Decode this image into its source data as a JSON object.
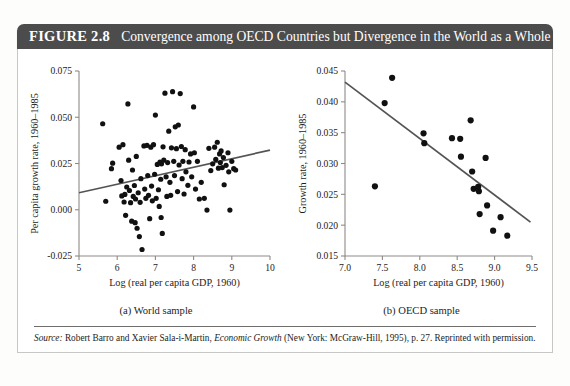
{
  "figure": {
    "number_label": "FIGURE 2.8",
    "title": "Convergence among OECD Countries but Divergence in the World as a Whole",
    "title_bar_color": "#4d4c4c",
    "title_text_color": "#ffffff",
    "border_color": "#c9c7c4",
    "source_prefix": "Source:",
    "source_text": " Robert Barro and Xavier Sala-i-Martin, ",
    "source_italic_work": "Economic Growth",
    "source_rest": " (New York: McGraw-Hill, 1995), p. 27. Reprinted with permission."
  },
  "captions": {
    "panel_a": "(a) World sample",
    "panel_b": "(b) OECD sample"
  },
  "chart_data": [
    {
      "type": "scatter",
      "panel": "a",
      "title": "",
      "xlabel": "Log (real per capita GDP, 1960)",
      "ylabel": "Per capita growth rate, 1960–1985",
      "xlim": [
        5,
        10
      ],
      "ylim": [
        -0.025,
        0.075
      ],
      "xticks": [
        5,
        6,
        7,
        8,
        9,
        10
      ],
      "xticklabels": [
        "5",
        "6",
        "7",
        "8",
        "9",
        "10"
      ],
      "yticks": [
        -0.025,
        0.0,
        0.025,
        0.05,
        0.075
      ],
      "yticklabels": [
        "-0.025",
        "0.000",
        "0.025",
        "0.050",
        "0.075"
      ],
      "grid": false,
      "legend": "none",
      "marker_color": "#111111",
      "trendline": {
        "color": "#555452",
        "x": [
          5.0,
          10.0
        ],
        "y": [
          0.0092,
          0.0322
        ]
      },
      "points": [
        [
          5.62,
          0.0465
        ],
        [
          5.7,
          0.0046
        ],
        [
          5.85,
          0.0222
        ],
        [
          5.88,
          0.0252
        ],
        [
          6.05,
          0.0338
        ],
        [
          6.1,
          0.0158
        ],
        [
          6.12,
          0.0075
        ],
        [
          6.15,
          0.0352
        ],
        [
          6.18,
          0.0042
        ],
        [
          6.2,
          0.0083
        ],
        [
          6.22,
          -0.003
        ],
        [
          6.25,
          0.0123
        ],
        [
          6.28,
          0.0572
        ],
        [
          6.3,
          0.0268
        ],
        [
          6.32,
          0.0104
        ],
        [
          6.35,
          0.0038
        ],
        [
          6.38,
          -0.0062
        ],
        [
          6.4,
          0.0215
        ],
        [
          6.42,
          0.0072
        ],
        [
          6.45,
          0.0131
        ],
        [
          6.47,
          -0.007
        ],
        [
          6.48,
          0.0058
        ],
        [
          6.5,
          0.0288
        ],
        [
          6.52,
          -0.01
        ],
        [
          6.55,
          0.0092
        ],
        [
          6.58,
          -0.0145
        ],
        [
          6.6,
          0.004
        ],
        [
          6.62,
          0.0168
        ],
        [
          6.65,
          -0.0215
        ],
        [
          6.7,
          0.0345
        ],
        [
          6.72,
          0.0112
        ],
        [
          6.75,
          0.0062
        ],
        [
          6.78,
          0.0348
        ],
        [
          6.8,
          0.0185
        ],
        [
          6.82,
          0.0078
        ],
        [
          6.85,
          -0.0048
        ],
        [
          6.88,
          0.0338
        ],
        [
          6.9,
          0.0128
        ],
        [
          6.92,
          0.0048
        ],
        [
          6.95,
          0.0352
        ],
        [
          6.98,
          0.0192
        ],
        [
          7.0,
          0.0512
        ],
        [
          7.02,
          0.0062
        ],
        [
          7.05,
          0.0245
        ],
        [
          7.08,
          0.0108
        ],
        [
          7.1,
          0.0018
        ],
        [
          7.12,
          0.0258
        ],
        [
          7.14,
          0.0165
        ],
        [
          7.15,
          -0.0042
        ],
        [
          7.16,
          0.0248
        ],
        [
          7.18,
          -0.0128
        ],
        [
          7.2,
          0.034
        ],
        [
          7.22,
          0.0268
        ],
        [
          7.25,
          0.063
        ],
        [
          7.28,
          0.0178
        ],
        [
          7.3,
          0.0072
        ],
        [
          7.32,
          0.0255
        ],
        [
          7.35,
          0.0425
        ],
        [
          7.38,
          0.0148
        ],
        [
          7.4,
          0.0078
        ],
        [
          7.42,
          0.0335
        ],
        [
          7.45,
          0.0638
        ],
        [
          7.48,
          0.0262
        ],
        [
          7.5,
          0.0185
        ],
        [
          7.52,
          0.0448
        ],
        [
          7.55,
          0.033
        ],
        [
          7.58,
          0.0098
        ],
        [
          7.6,
          0.0458
        ],
        [
          7.62,
          0.0242
        ],
        [
          7.65,
          0.0628
        ],
        [
          7.68,
          0.0342
        ],
        [
          7.7,
          0.0168
        ],
        [
          7.72,
          0.0262
        ],
        [
          7.75,
          0.0085
        ],
        [
          7.78,
          0.0325
        ],
        [
          7.8,
          0.0205
        ],
        [
          7.85,
          0.0132
        ],
        [
          7.88,
          0.0258
        ],
        [
          7.92,
          0.0302
        ],
        [
          7.95,
          0.0178
        ],
        [
          8.0,
          0.0556
        ],
        [
          8.02,
          0.0308
        ],
        [
          8.05,
          0.0112
        ],
        [
          8.1,
          0.0262
        ],
        [
          8.15,
          0.0058
        ],
        [
          8.2,
          0.0148
        ],
        [
          8.28,
          0.0062
        ],
        [
          8.35,
          -0.0002
        ],
        [
          8.4,
          0.0332
        ],
        [
          8.45,
          0.0212
        ],
        [
          8.5,
          0.0248
        ],
        [
          8.55,
          0.0338
        ],
        [
          8.58,
          0.0272
        ],
        [
          8.62,
          0.0365
        ],
        [
          8.65,
          0.0225
        ],
        [
          8.68,
          0.0302
        ],
        [
          8.7,
          0.0255
        ],
        [
          8.72,
          0.0318
        ],
        [
          8.75,
          0.0228
        ],
        [
          8.78,
          0.0282
        ],
        [
          8.8,
          0.0135
        ],
        [
          8.85,
          0.024
        ],
        [
          8.9,
          0.0308
        ],
        [
          8.92,
          0.0205
        ],
        [
          8.95,
          -0.0002
        ],
        [
          9.0,
          0.0262
        ],
        [
          9.05,
          0.0222
        ],
        [
          9.1,
          0.0215
        ]
      ]
    },
    {
      "type": "scatter",
      "panel": "b",
      "title": "",
      "xlabel": "Log (real per capita GDP, 1960)",
      "ylabel": "Growth rate, 1960–1985",
      "xlim": [
        7.0,
        9.5
      ],
      "ylim": [
        0.015,
        0.045
      ],
      "xticks": [
        7.0,
        7.5,
        8.0,
        8.5,
        9.0,
        9.5
      ],
      "xticklabels": [
        "7.0",
        "7.5",
        "8.0",
        "8.5",
        "9.0",
        "9.5"
      ],
      "yticks": [
        0.015,
        0.02,
        0.025,
        0.03,
        0.035,
        0.04,
        0.045
      ],
      "yticklabels": [
        "0.015",
        "0.020",
        "0.025",
        "0.030",
        "0.035",
        "0.040",
        "0.045"
      ],
      "grid": false,
      "legend": "none",
      "marker_color": "#111111",
      "trendline": {
        "color": "#555452",
        "x": [
          7.0,
          9.48
        ],
        "y": [
          0.0432,
          0.0205
        ]
      },
      "points": [
        [
          7.4,
          0.0263
        ],
        [
          7.53,
          0.0398
        ],
        [
          7.63,
          0.0439
        ],
        [
          8.05,
          0.0349
        ],
        [
          8.06,
          0.0333
        ],
        [
          8.43,
          0.0341
        ],
        [
          8.54,
          0.034
        ],
        [
          8.55,
          0.0311
        ],
        [
          8.68,
          0.037
        ],
        [
          8.7,
          0.0287
        ],
        [
          8.72,
          0.0259
        ],
        [
          8.78,
          0.0262
        ],
        [
          8.79,
          0.0255
        ],
        [
          8.8,
          0.0218
        ],
        [
          8.88,
          0.0309
        ],
        [
          8.9,
          0.0232
        ],
        [
          8.98,
          0.0191
        ],
        [
          9.08,
          0.0213
        ],
        [
          9.17,
          0.0183
        ]
      ]
    }
  ]
}
